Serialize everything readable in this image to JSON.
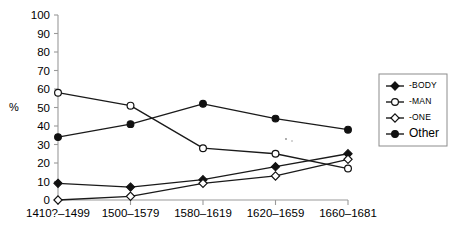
{
  "chart_data": {
    "type": "line",
    "title": "",
    "xlabel": "",
    "ylabel": "%",
    "ylim": [
      0,
      100
    ],
    "ytick_step": 10,
    "grid": false,
    "legend_position": "right",
    "categories": [
      "1410?–1499",
      "1500–1579",
      "1580–1619",
      "1620–1659",
      "1660–1681"
    ],
    "ytick_labels": [
      "0",
      "10",
      "20",
      "30",
      "40",
      "50",
      "60",
      "70",
      "80",
      "90",
      "100"
    ],
    "series": [
      {
        "name": "-BODY",
        "marker": "filled-diamond",
        "values": [
          9,
          7,
          11,
          18,
          25
        ]
      },
      {
        "name": "-MAN",
        "marker": "open-circle",
        "values": [
          58,
          51,
          28,
          25,
          17
        ]
      },
      {
        "name": "-ONE",
        "marker": "open-diamond",
        "values": [
          0,
          2,
          9,
          13,
          22
        ]
      },
      {
        "name": "Other",
        "marker": "filled-circle",
        "values": [
          34,
          41,
          52,
          44,
          38
        ]
      }
    ]
  },
  "axes": {
    "y_axis_title": "%"
  },
  "legend": {
    "entries": [
      {
        "label": "-BODY",
        "marker": "filled-diamond",
        "size": "small"
      },
      {
        "label": "-MAN",
        "marker": "open-circle",
        "size": "small"
      },
      {
        "label": "-ONE",
        "marker": "open-diamond",
        "size": "small"
      },
      {
        "label": "Other",
        "marker": "filled-circle",
        "size": "big"
      }
    ]
  },
  "colors": {
    "ink": "#111111",
    "axis": "#9a9a9a",
    "background": "#ffffff",
    "legend_border": "#8c8c8c"
  }
}
